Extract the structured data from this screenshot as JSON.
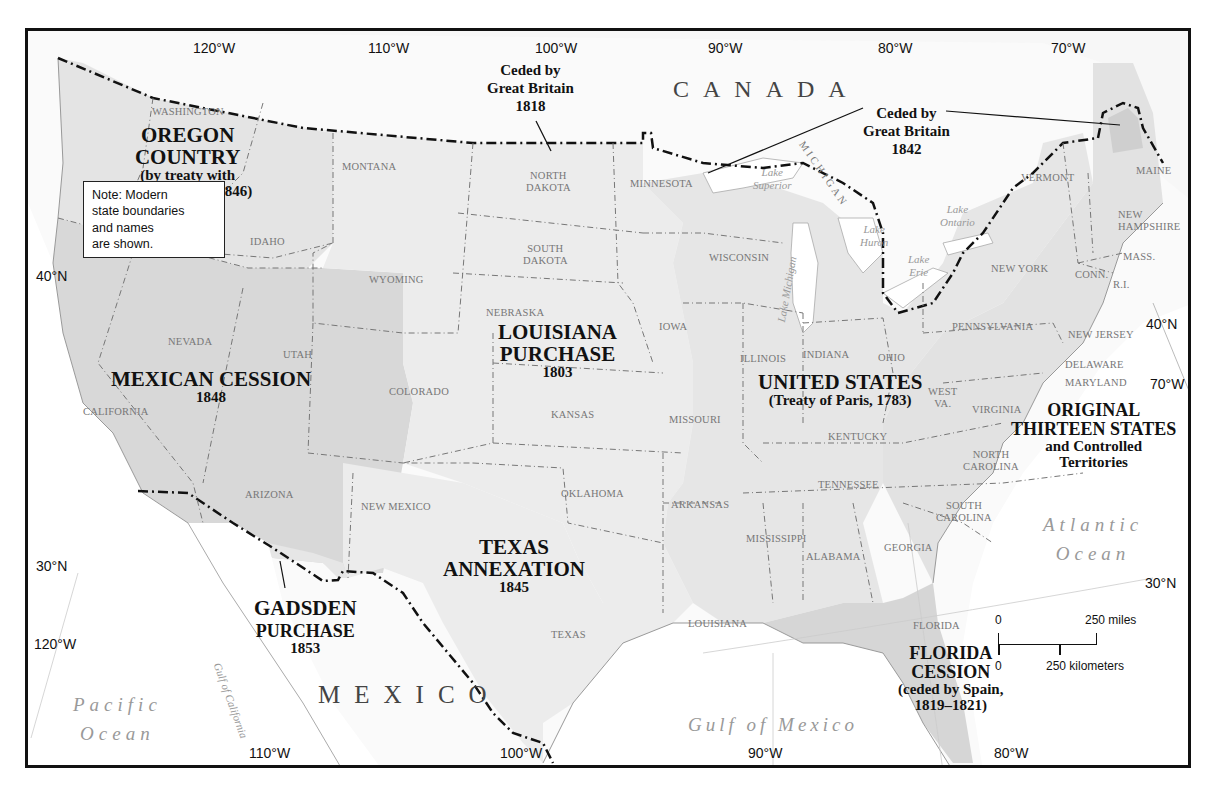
{
  "map": {
    "title": "Territorial Growth of the United States",
    "regions": [
      {
        "id": "oregon",
        "name": "OREGON COUNTRY",
        "sub": "(by treaty with Great Britain, 1846)"
      },
      {
        "id": "mexican",
        "name": "MEXICAN CESSION",
        "year": "1848"
      },
      {
        "id": "louisiana",
        "name": "LOUISIANA PURCHASE",
        "year": "1803"
      },
      {
        "id": "texas",
        "name": "TEXAS ANNEXATION",
        "year": "1845"
      },
      {
        "id": "gadsden",
        "name": "GADSDEN PURCHASE",
        "year": "1853"
      },
      {
        "id": "us",
        "name": "UNITED STATES",
        "sub": "(Treaty of Paris, 1783)"
      },
      {
        "id": "original",
        "name": "ORIGINAL THIRTEEN STATES",
        "sub": "and Controlled Territories"
      },
      {
        "id": "florida",
        "name": "FLORIDA CESSION",
        "sub": "(ceded by Spain, 1819–1821)"
      }
    ],
    "region_labels": {
      "oregon_l1": "OREGON",
      "oregon_l2": "COUNTRY",
      "oregon_s1": "(by treaty with",
      "oregon_s2": "Great Britain, 1846)",
      "mexican_l1": "MEXICAN CESSION",
      "mexican_yr": "1848",
      "louisiana_l1": "LOUISIANA",
      "louisiana_l2": "PURCHASE",
      "louisiana_yr": "1803",
      "texas_l1": "TEXAS",
      "texas_l2": "ANNEXATION",
      "texas_yr": "1845",
      "gadsden_l1": "GADSDEN",
      "gadsden_l2": "PURCHASE",
      "gadsden_yr": "1853",
      "us_l1": "UNITED STATES",
      "us_sub": "(Treaty of Paris, 1783)",
      "orig_l1": "ORIGINAL",
      "orig_l2": "THIRTEEN STATES",
      "orig_s1": "and Controlled",
      "orig_s2": "Territories",
      "florida_l1": "FLORIDA",
      "florida_l2": "CESSION",
      "florida_s1": "(ceded by Spain,",
      "florida_s2": "1819–1821)"
    },
    "ceded_labels": {
      "gb1818_l1": "Ceded by",
      "gb1818_l2": "Great Britain",
      "gb1818_yr": "1818",
      "gb1842_l1": "Ceded by",
      "gb1842_l2": "Great Britain",
      "gb1842_yr": "1842"
    },
    "countries": {
      "canada": "CANADA",
      "mexico": "MEXICO"
    },
    "water": {
      "pacific_l1": "Pacific",
      "pacific_l2": "Ocean",
      "atlantic_l1": "Atlantic",
      "atlantic_l2": "Ocean",
      "gulf_mexico": "Gulf of Mexico",
      "gulf_california": "Gulf of California",
      "lake_superior_l1": "Lake",
      "lake_superior_l2": "Superior",
      "lake_michigan": "Lake Michigan",
      "lake_huron_l1": "Lake",
      "lake_huron_l2": "Huron",
      "lake_erie_l1": "Lake",
      "lake_erie_l2": "Erie",
      "lake_ontario_l1": "Lake",
      "lake_ontario_l2": "Ontario"
    },
    "states": {
      "washington": "WASHINGTON",
      "oregon": "OREGON",
      "idaho": "IDAHO",
      "montana": "MONTANA",
      "wyoming": "WYOMING",
      "nevada": "NEVADA",
      "utah": "UTAH",
      "california": "CALIFORNIA",
      "arizona": "ARIZONA",
      "colorado": "COLORADO",
      "new_mexico": "NEW MEXICO",
      "north_dakota_l1": "NORTH",
      "north_dakota_l2": "DAKOTA",
      "south_dakota_l1": "SOUTH",
      "south_dakota_l2": "DAKOTA",
      "nebraska": "NEBRASKA",
      "kansas": "KANSAS",
      "oklahoma": "OKLAHOMA",
      "texas": "TEXAS",
      "minnesota": "MINNESOTA",
      "iowa": "IOWA",
      "missouri": "MISSOURI",
      "arkansas": "ARKANSAS",
      "louisiana": "LOUISIANA",
      "wisconsin": "WISCONSIN",
      "michigan": "MICHIGAN",
      "illinois": "ILLINOIS",
      "indiana": "INDIANA",
      "ohio": "OHIO",
      "kentucky": "KENTUCKY",
      "tennessee": "TENNESSEE",
      "mississippi": "MISSISSIPPI",
      "alabama": "ALABAMA",
      "georgia": "GEORGIA",
      "florida": "FLORIDA",
      "south_carolina_l1": "SOUTH",
      "south_carolina_l2": "CAROLINA",
      "north_carolina_l1": "NORTH",
      "north_carolina_l2": "CAROLINA",
      "virginia": "VIRGINIA",
      "west_virginia_l1": "WEST",
      "west_virginia_l2": "VA.",
      "maryland": "MARYLAND",
      "delaware": "DELAWARE",
      "new_jersey": "NEW JERSEY",
      "pennsylvania": "PENNSYLVANIA",
      "new_york": "NEW YORK",
      "connecticut": "CONN.",
      "rhode_island": "R.I.",
      "massachusetts": "MASS.",
      "vermont": "VERMONT",
      "new_hampshire_l1": "NEW",
      "new_hampshire_l2": "HAMPSHIRE",
      "maine": "MAINE"
    },
    "coordinates": {
      "top": [
        "120°W",
        "110°W",
        "100°W",
        "90°W",
        "80°W",
        "70°W"
      ],
      "bottom": [
        "110°W",
        "100°W",
        "90°W",
        "80°W"
      ],
      "left": [
        "40°N",
        "30°N",
        "120°W"
      ],
      "right": [
        "40°N",
        "70°W",
        "30°N"
      ]
    },
    "note": {
      "l1": "Note: Modern",
      "l2": "state boundaries",
      "l3": "and names",
      "l4": "are shown."
    },
    "scale": {
      "miles_zero": "0",
      "miles_label": "250 miles",
      "km_zero": "0",
      "km_label": "250 kilometers"
    },
    "colors": {
      "frame": "#111111",
      "background": "#fafafa",
      "us_territory": "#e6e6e6",
      "mexican_cession": "#d8d8d8",
      "oregon_country": "#e4e4e4",
      "louisiana_purchase": "#ececec",
      "original_thirteen": "#e2e2e2",
      "florida_cession": "#d6d6d6",
      "boundary_line": "#111111",
      "state_line": "#666666",
      "state_text": "#777777"
    }
  }
}
